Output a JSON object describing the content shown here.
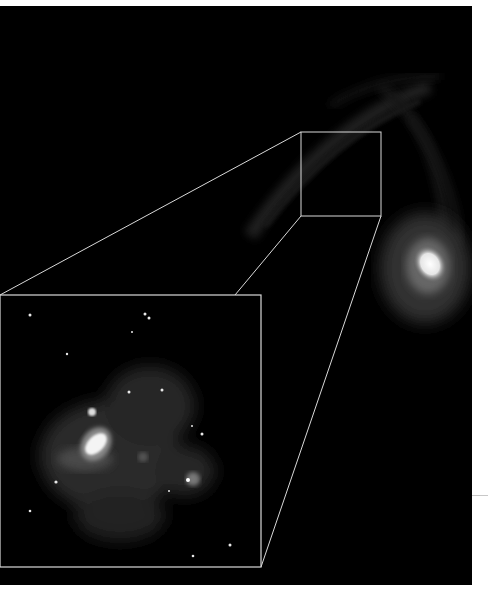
{
  "image": {
    "description": "Astronomical image: galaxy arm with zoomed inset of a nebula region",
    "background_color": "#000000",
    "border_color": "#d9d9d9"
  },
  "source_box": {
    "x": 301,
    "y": 126,
    "width": 80,
    "height": 84
  },
  "inset_box": {
    "x": 0,
    "y": 289,
    "width": 261,
    "height": 272
  },
  "objects": {
    "galaxy_arm": "faint spiral arc upper right",
    "bright_core": "bright elliptical blob at right edge",
    "nebula": "diffuse gray cloud with bright knot inside inset",
    "stars": "scattered point sources"
  }
}
